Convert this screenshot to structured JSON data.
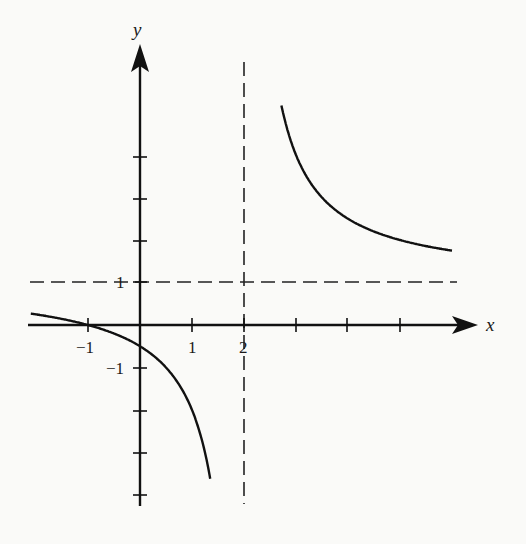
{
  "chart_data": {
    "type": "line",
    "title": "",
    "function_form": "y = (x + 1)/(x - 2)",
    "xlabel": "x",
    "ylabel": "y",
    "xlim": [
      -2.1,
      6.5
    ],
    "ylim": [
      -4.2,
      6.5
    ],
    "x_ticks": [
      -1,
      1,
      2,
      3,
      4,
      5
    ],
    "x_tick_labels": [
      "-1",
      "1",
      "2"
    ],
    "y_ticks": [
      -4,
      -3,
      -2,
      -1,
      1,
      2,
      3,
      4
    ],
    "y_tick_labels": [
      "1",
      "-1"
    ],
    "asymptotes": [
      {
        "type": "vertical",
        "value": 2,
        "style": "dashed"
      },
      {
        "type": "horizontal",
        "value": 1,
        "style": "dashed"
      }
    ],
    "series": [
      {
        "name": "left branch",
        "x": [
          -2.1,
          -1.5,
          -1,
          -0.5,
          0,
          0.5,
          1,
          1.35
        ],
        "y": [
          0.27,
          0.14,
          0,
          -0.2,
          -0.5,
          -1.0,
          -2.0,
          -4.2
        ]
      },
      {
        "name": "right branch",
        "x": [
          2.7,
          3,
          3.5,
          4,
          4.5,
          5,
          5.5,
          6
        ],
        "y": [
          6.2,
          4.0,
          3.0,
          2.5,
          2.2,
          2.0,
          1.86,
          1.75
        ]
      }
    ],
    "grid": false,
    "legend": null,
    "colors": {
      "curve": "#1a1a1a",
      "axes": "#1a1a1a",
      "asymptote": "#1a1a1a",
      "background": "#fafaf8"
    }
  },
  "labels": {
    "x_axis": "x",
    "y_axis": "y",
    "tick_neg1_x": "−1",
    "tick_1_x": "1",
    "tick_2_x": "2",
    "tick_1_y": "1",
    "tick_neg1_y": "−1"
  }
}
